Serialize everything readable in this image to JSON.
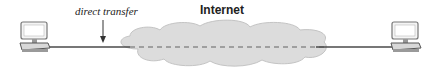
{
  "diagram": {
    "cloud_label": "Internet",
    "annotation_label": "direct transfer",
    "nodes": [
      {
        "id": "left-host",
        "icon": "desktop-computer-icon"
      },
      {
        "id": "right-host",
        "icon": "desktop-computer-icon"
      }
    ],
    "edges": [
      {
        "from": "left-host",
        "to": "right-host",
        "style": "solid-outside-cloud-dashed-inside"
      }
    ],
    "colors": {
      "line": "#4a4a4a",
      "cloud_fill": "#dcdcdc",
      "cloud_stroke": "#c4c4c4",
      "dash": "#8a8a8a",
      "computer_fill": "#e6e6e6",
      "computer_stroke": "#555555"
    }
  }
}
